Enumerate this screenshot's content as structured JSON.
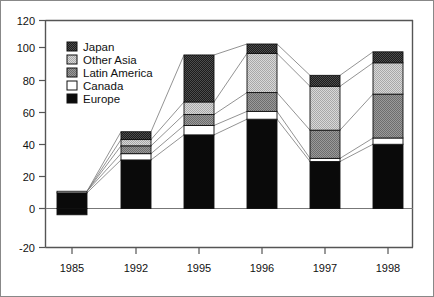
{
  "chart_data": {
    "type": "bar",
    "subtype": "stacked-bar",
    "title": "",
    "xlabel": "",
    "ylabel": "",
    "categories": [
      "1985",
      "1992",
      "1995",
      "1996",
      "1997",
      "1998"
    ],
    "series": [
      {
        "name": "Europe",
        "values": [
          10,
          31,
          47,
          57,
          30,
          41
        ]
      },
      {
        "name": "Canada",
        "values": [
          1,
          4,
          6,
          5,
          2,
          4
        ]
      },
      {
        "name": "Latin America",
        "values": [
          0,
          5,
          7,
          12,
          18,
          28
        ]
      },
      {
        "name": "Other Asia",
        "values": [
          0,
          4,
          8,
          25,
          28,
          20
        ]
      },
      {
        "name": "Japan",
        "values": [
          0,
          5,
          30,
          6,
          7,
          7
        ]
      }
    ],
    "negative_values": [
      -4,
      0,
      0,
      0,
      0,
      0
    ],
    "totals": [
      11,
      49,
      98,
      105,
      85,
      100
    ],
    "ylim": [
      -20,
      120
    ],
    "yticks": [
      -20,
      0,
      20,
      40,
      60,
      80,
      100,
      120
    ],
    "ytick_labels": [
      "-20",
      "0",
      "20",
      "40",
      "60",
      "80",
      "100",
      "120"
    ],
    "grid": false,
    "legend_position": "upper-left",
    "connector_lines": true,
    "legend_entries": [
      {
        "label": "Japan",
        "pattern": "dark-check"
      },
      {
        "label": "Other Asia",
        "pattern": "light-check"
      },
      {
        "label": "Latin America",
        "pattern": "medium-check"
      },
      {
        "label": "Canada",
        "pattern": "white"
      },
      {
        "label": "Europe",
        "pattern": "solid-black"
      }
    ]
  },
  "colors": {
    "japan": "#1c1c1c",
    "other_asia": "#c9c9c9",
    "latin_america": "#8a8a8a",
    "canada": "#ffffff",
    "europe": "#0a0a0a",
    "axis": "#555555",
    "frame": "#555555",
    "connector": "#777777",
    "text": "#111111"
  }
}
